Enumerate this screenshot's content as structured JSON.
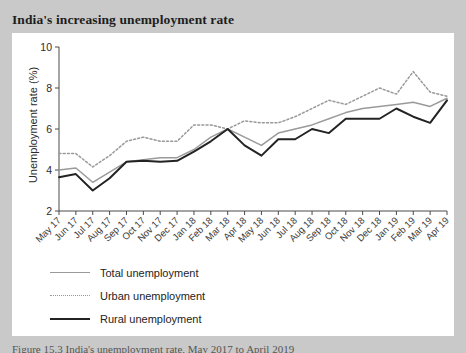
{
  "figure": {
    "title": "India's increasing unemployment rate",
    "caption": "Figure 15.3 India's unemployment rate, May 2017 to April 2019"
  },
  "legend": {
    "items": [
      {
        "label": "Total unemployment",
        "style": "solid",
        "color": "#9a9a9a",
        "key": "total-unemployment"
      },
      {
        "label": "Urban unemployment",
        "style": "dotted",
        "color": "#9a9a9a",
        "key": "urban-unemployment"
      },
      {
        "label": "Rural unemployment",
        "style": "solid",
        "color": "#232323",
        "key": "rural-unemployment"
      }
    ]
  },
  "axes": {
    "ylabel": "Unemployment rate (%)",
    "yticks": [
      "2",
      "4",
      "6",
      "8",
      "10"
    ],
    "ymin": 2,
    "ymax": 10,
    "xlabel": ""
  },
  "chart_data": {
    "type": "line",
    "title": "India's increasing unemployment rate",
    "xlabel": "",
    "ylabel": "Unemployment rate (%)",
    "ylim": [
      2,
      10
    ],
    "grid": false,
    "legend_position": "below-axes-left",
    "categories": [
      "May 17",
      "Jun 17",
      "Jul 17",
      "Aug 17",
      "Sep 17",
      "Oct 17",
      "Nov 17",
      "Dec 17",
      "Jan 18",
      "Feb 18",
      "Mar 18",
      "Apr 18",
      "May 18",
      "Jun 18",
      "Jul 18",
      "Aug 18",
      "Sep 18",
      "Oct 18",
      "Nov 18",
      "Dec 18",
      "Jan 19",
      "Feb 19",
      "Mar 19",
      "Apr 19"
    ],
    "series": [
      {
        "name": "Total unemployment",
        "color": "#9a9a9a",
        "style": "solid",
        "values": [
          4.0,
          4.1,
          3.4,
          3.9,
          4.4,
          4.5,
          4.6,
          4.6,
          5.0,
          5.6,
          6.0,
          5.6,
          5.2,
          5.8,
          6.0,
          6.2,
          6.5,
          6.8,
          7.0,
          7.1,
          7.2,
          7.3,
          7.1,
          7.5
        ],
        "point_estimates_note": "read from pixel positions; ±0.1"
      },
      {
        "name": "Urban unemployment",
        "color": "#9a9a9a",
        "style": "dotted",
        "values": [
          4.8,
          4.8,
          4.15,
          4.7,
          5.4,
          5.6,
          5.4,
          5.4,
          6.2,
          6.2,
          6.0,
          6.4,
          6.3,
          6.3,
          6.6,
          7.0,
          7.4,
          7.2,
          7.6,
          8.0,
          7.7,
          8.8,
          7.8,
          7.6
        ],
        "point_estimates_note": "read from pixel positions; ±0.1"
      },
      {
        "name": "Rural unemployment",
        "color": "#232323",
        "style": "solid",
        "values": [
          3.65,
          3.8,
          3.0,
          3.6,
          4.4,
          4.45,
          4.4,
          4.45,
          4.9,
          5.4,
          6.0,
          5.2,
          4.7,
          5.5,
          5.5,
          6.0,
          5.8,
          6.5,
          6.5,
          6.5,
          7.0,
          6.6,
          6.3,
          7.4
        ],
        "point_estimates_note": "read from pixel positions; ±0.1"
      }
    ]
  }
}
